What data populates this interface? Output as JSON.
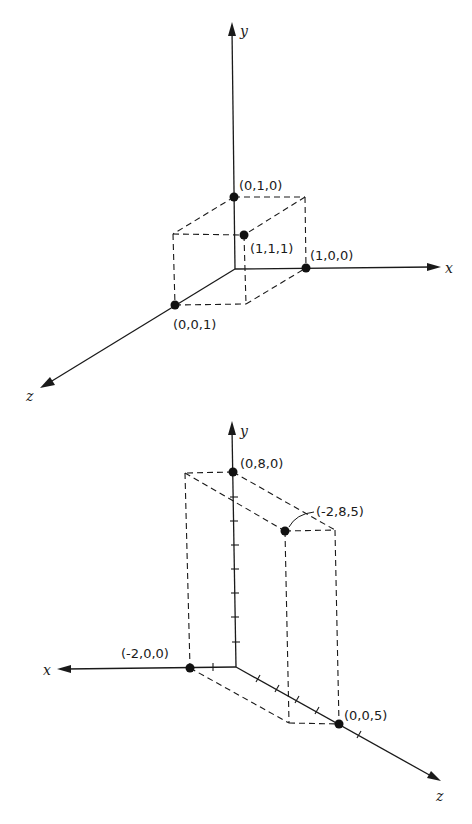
{
  "figures": [
    {
      "id": "unit-cube",
      "axes": {
        "x": {
          "label": "x",
          "from": [
            235,
            269
          ],
          "to": [
            440,
            267
          ]
        },
        "y": {
          "label": "y",
          "from": [
            235,
            269
          ],
          "to": [
            232,
            23
          ]
        },
        "z": {
          "label": "z",
          "from": [
            235,
            269
          ],
          "to": [
            40,
            388
          ]
        }
      },
      "points": [
        {
          "label": "(0,1,0)",
          "pos": [
            234,
            197
          ],
          "label_pos": [
            239,
            189
          ]
        },
        {
          "label": "(1,1,1)",
          "pos": [
            244,
            235
          ],
          "label_pos": [
            250,
            252
          ]
        },
        {
          "label": "(1,0,0)",
          "pos": [
            306,
            268
          ],
          "label_pos": [
            310,
            258
          ]
        },
        {
          "label": "(0,0,1)",
          "pos": [
            175,
            305
          ],
          "label_pos": [
            174,
            327
          ]
        }
      ]
    },
    {
      "id": "box-2-8-5",
      "axes": {
        "x": {
          "label": "x",
          "from": [
            236,
            667
          ],
          "to": [
            58,
            669
          ]
        },
        "y": {
          "label": "y",
          "from": [
            236,
            667
          ],
          "to": [
            232,
            422
          ]
        },
        "z": {
          "label": "z",
          "from": [
            236,
            667
          ],
          "to": [
            440,
            781
          ]
        }
      },
      "points": [
        {
          "label": "(0,8,0)",
          "pos": [
            233,
            472
          ],
          "label_pos": [
            240,
            467
          ]
        },
        {
          "label": "(-2,8,5)",
          "pos": [
            285,
            531
          ],
          "label_pos": [
            316,
            515
          ]
        },
        {
          "label": "(-2,0,0)",
          "pos": [
            190,
            668
          ],
          "label_pos": [
            121,
            656
          ]
        },
        {
          "label": "(0,0,5)",
          "pos": [
            339,
            724
          ],
          "label_pos": [
            344,
            719
          ]
        }
      ],
      "y_ticks": 7,
      "x_ticks": 1,
      "z_ticks": 6
    }
  ],
  "labels": {
    "top": {
      "x": "x",
      "y": "y",
      "z": "z",
      "p010": "(0,1,0)",
      "p111": "(1,1,1)",
      "p100": "(1,0,0)",
      "p001": "(0,0,1)"
    },
    "bottom": {
      "x": "x",
      "y": "y",
      "z": "z",
      "p080": "(0,8,0)",
      "p285": "(-2,8,5)",
      "p200": "(-2,0,0)",
      "p005": "(0,0,5)"
    }
  },
  "colors": {
    "ink": "#1a1a1a",
    "background": "#ffffff"
  }
}
